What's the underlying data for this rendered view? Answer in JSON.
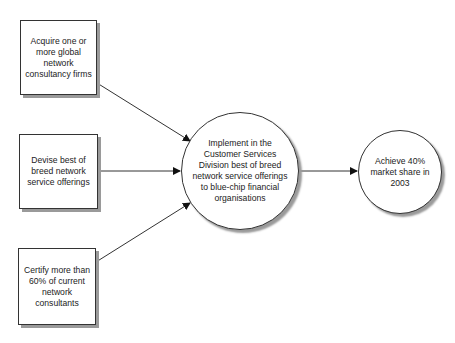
{
  "diagram": {
    "type": "flow",
    "nodes": [
      {
        "id": "n1",
        "shape": "box",
        "label": "Acquire one or more global network consultancy firms"
      },
      {
        "id": "n2",
        "shape": "box",
        "label": "Devise best of breed network service offerings"
      },
      {
        "id": "n3",
        "shape": "box",
        "label": "Certify more than 60% of current network consultants"
      },
      {
        "id": "n4",
        "shape": "circle",
        "label": "Implement in the Customer Services Division best of breed network service offerings to blue-chip financial organisations"
      },
      {
        "id": "n5",
        "shape": "circle",
        "label": "Achieve 40% market share in 2003"
      }
    ],
    "edges": [
      {
        "from": "n1",
        "to": "n4"
      },
      {
        "from": "n2",
        "to": "n4"
      },
      {
        "from": "n3",
        "to": "n4"
      },
      {
        "from": "n4",
        "to": "n5"
      }
    ],
    "colors": {
      "line": "#333333",
      "shadow": "#9a9a9a",
      "fill": "#ffffff"
    }
  }
}
